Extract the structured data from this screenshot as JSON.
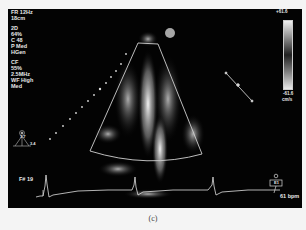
{
  "display": {
    "params_top": [
      "FR 12Hz",
      "18cm"
    ],
    "params_2d": [
      "2D",
      "64%",
      "C 48",
      "P Med",
      "HGen"
    ],
    "params_cf": [
      "CF",
      "55%",
      "2.5MHz",
      "WF High",
      "Med"
    ],
    "scale_top_label": "+61.6",
    "scale_bottom_label": "-61.6",
    "scale_unit": "cm/s",
    "frame_label": "F# 19",
    "heart_rate": "61 bpm",
    "probe_icon_label": "probe-orientation",
    "probe_values": [
      "1.7",
      "3.4"
    ],
    "right_box_label": "E1"
  },
  "caption": "(c)",
  "colors": {
    "background": "#030303",
    "page": "#f4f4f4",
    "text": "#e8e8e8",
    "sector_outline": "#d0d0d0"
  }
}
